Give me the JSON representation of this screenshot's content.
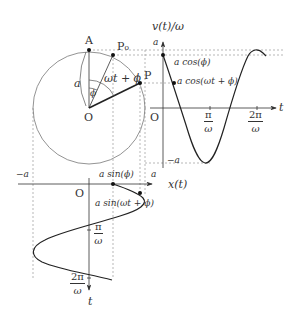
{
  "diagram": {
    "type": "uniform circular motion and simple harmonic motion projection",
    "circle": {
      "center_label": "O",
      "top_point_label": "A",
      "initial_point_label": "P₀",
      "current_point_label": "P",
      "radius_label": "a",
      "initial_angle_label": "ϕ",
      "current_angle_label": "ωt + ϕ"
    },
    "velocity_plot": {
      "y_axis_label": "v(t)/ω",
      "x_axis_label": "t",
      "origin_label": "O",
      "max_label": "a",
      "min_label": "−a",
      "point_initial_label": "a cos(ϕ)",
      "point_current_label": "a cos(ωt + ϕ)",
      "tick1": {
        "num": "π",
        "den": "ω"
      },
      "tick2": {
        "num": "2π",
        "den": "ω"
      }
    },
    "position_plot": {
      "x_axis_label": "x(t)",
      "t_axis_label": "t",
      "origin_label": "O",
      "left_label": "−a",
      "right_label": "a",
      "point_initial_label": "a sin(ϕ)",
      "point_current_label": "a sin(ωt + ϕ)",
      "tick1": {
        "num": "π",
        "den": "ω"
      },
      "tick2": {
        "num": "2π",
        "den": "ω"
      }
    },
    "colors": {
      "stroke": "#333333",
      "guide": "#999999",
      "background": "#ffffff"
    }
  }
}
